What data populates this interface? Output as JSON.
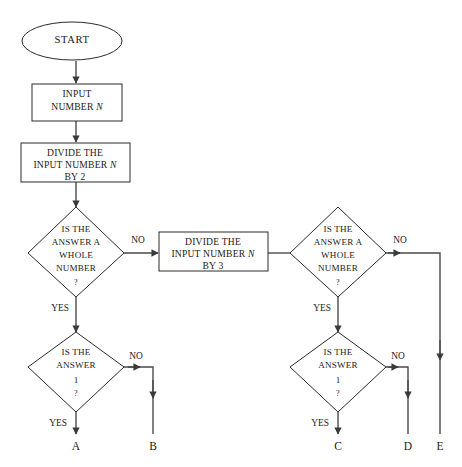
{
  "diagram": {
    "background_color": "#ffffff",
    "stroke_color": "#2b2b2b",
    "line_color": "#4a4a4a",
    "text_color": "#1a1a1a"
  },
  "nodes": {
    "start": {
      "shape": "oval",
      "label": "START"
    },
    "input_number": {
      "shape": "rectangle",
      "line1": "INPUT",
      "line2": "NUMBER",
      "var": "N"
    },
    "divide_by_2": {
      "shape": "rectangle",
      "line1": "DIVIDE THE",
      "line2a": "INPUT  NUMBER",
      "var": "N",
      "line3": "BY 2"
    },
    "divide_by_3": {
      "shape": "rectangle",
      "line1": "DIVIDE THE",
      "line2a": "INPUT  NUMBER",
      "var": "N",
      "line3": "BY 3"
    },
    "whole_number_left": {
      "shape": "diamond",
      "line1": "IS THE",
      "line2": "ANSWER A",
      "line3": "WHOLE",
      "line4": "NUMBER",
      "line5": "?"
    },
    "whole_number_right": {
      "shape": "diamond",
      "line1": "IS THE",
      "line2": "ANSWER A",
      "line3": "WHOLE",
      "line4": "NUMBER",
      "line5": "?"
    },
    "answer_one_left": {
      "shape": "diamond",
      "line1": "IS THE",
      "line2": "ANSWER",
      "line3": "1",
      "line4": "?"
    },
    "answer_one_right": {
      "shape": "diamond",
      "line1": "IS THE",
      "line2": "ANSWER",
      "line3": "1",
      "line4": "?"
    }
  },
  "edge_labels": {
    "whole_left_no": "NO",
    "whole_left_yes": "YES",
    "whole_right_no": "NO",
    "whole_right_yes": "YES",
    "one_left_no": "NO",
    "one_left_yes": "YES",
    "one_right_no": "NO",
    "one_right_yes": "YES"
  },
  "terminals": {
    "a": "A",
    "b": "B",
    "c": "C",
    "d": "D",
    "e": "E"
  }
}
